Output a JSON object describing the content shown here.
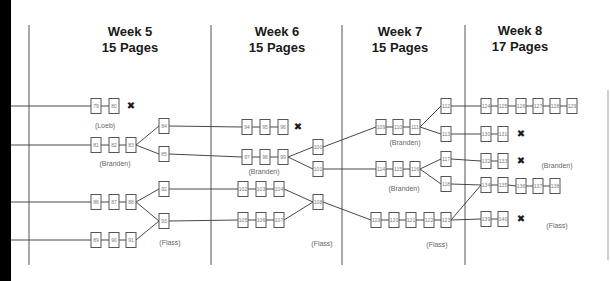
{
  "diagram": {
    "weeks": [
      {
        "title": "Week 5",
        "pages": "15 Pages",
        "x": 130
      },
      {
        "title": "Week 6",
        "pages": "15 Pages",
        "x": 277
      },
      {
        "title": "Week 7",
        "pages": "15 Pages",
        "x": 400
      },
      {
        "title": "Week 8",
        "pages": "17 Pages",
        "x": 520
      }
    ],
    "dividers": [
      29,
      211,
      342,
      465
    ],
    "nodes": [
      {
        "id": "79",
        "x": 96,
        "y": 106
      },
      {
        "id": "80",
        "x": 114,
        "y": 106
      },
      {
        "id": "81",
        "x": 96,
        "y": 145
      },
      {
        "id": "82",
        "x": 114,
        "y": 145
      },
      {
        "id": "83",
        "x": 131,
        "y": 145
      },
      {
        "id": "84",
        "x": 164,
        "y": 126
      },
      {
        "id": "85",
        "x": 164,
        "y": 154
      },
      {
        "id": "86",
        "x": 96,
        "y": 202
      },
      {
        "id": "87",
        "x": 114,
        "y": 202
      },
      {
        "id": "88",
        "x": 131,
        "y": 202
      },
      {
        "id": "89",
        "x": 96,
        "y": 240
      },
      {
        "id": "90",
        "x": 114,
        "y": 240
      },
      {
        "id": "91",
        "x": 131,
        "y": 240
      },
      {
        "id": "92",
        "x": 164,
        "y": 189
      },
      {
        "id": "93",
        "x": 164,
        "y": 221
      },
      {
        "id": "94",
        "x": 247,
        "y": 127
      },
      {
        "id": "95",
        "x": 265,
        "y": 127
      },
      {
        "id": "96",
        "x": 283,
        "y": 127
      },
      {
        "id": "97",
        "x": 247,
        "y": 157
      },
      {
        "id": "98",
        "x": 265,
        "y": 157
      },
      {
        "id": "99",
        "x": 283,
        "y": 157
      },
      {
        "id": "100",
        "x": 318,
        "y": 147
      },
      {
        "id": "101",
        "x": 318,
        "y": 169
      },
      {
        "id": "102",
        "x": 243,
        "y": 189
      },
      {
        "id": "103",
        "x": 261,
        "y": 189
      },
      {
        "id": "104",
        "x": 279,
        "y": 189
      },
      {
        "id": "105",
        "x": 243,
        "y": 220
      },
      {
        "id": "106",
        "x": 261,
        "y": 220
      },
      {
        "id": "107",
        "x": 279,
        "y": 220
      },
      {
        "id": "108",
        "x": 318,
        "y": 202
      },
      {
        "id": "109",
        "x": 381,
        "y": 127
      },
      {
        "id": "110",
        "x": 398,
        "y": 127
      },
      {
        "id": "111",
        "x": 415,
        "y": 127
      },
      {
        "id": "112",
        "x": 446,
        "y": 106
      },
      {
        "id": "113",
        "x": 446,
        "y": 134
      },
      {
        "id": "114",
        "x": 381,
        "y": 169
      },
      {
        "id": "115",
        "x": 398,
        "y": 169
      },
      {
        "id": "116",
        "x": 415,
        "y": 169
      },
      {
        "id": "117",
        "x": 446,
        "y": 159
      },
      {
        "id": "118",
        "x": 446,
        "y": 184
      },
      {
        "id": "119",
        "x": 376,
        "y": 220
      },
      {
        "id": "120",
        "x": 394,
        "y": 220
      },
      {
        "id": "121",
        "x": 411,
        "y": 220
      },
      {
        "id": "122",
        "x": 429,
        "y": 220
      },
      {
        "id": "123",
        "x": 446,
        "y": 220
      },
      {
        "id": "124",
        "x": 486,
        "y": 106
      },
      {
        "id": "125",
        "x": 503,
        "y": 106
      },
      {
        "id": "126",
        "x": 521,
        "y": 106
      },
      {
        "id": "127",
        "x": 538,
        "y": 106
      },
      {
        "id": "128",
        "x": 555,
        "y": 106
      },
      {
        "id": "129",
        "x": 572,
        "y": 106
      },
      {
        "id": "130",
        "x": 486,
        "y": 134
      },
      {
        "id": "131",
        "x": 503,
        "y": 134
      },
      {
        "id": "132",
        "x": 486,
        "y": 161
      },
      {
        "id": "133",
        "x": 503,
        "y": 161
      },
      {
        "id": "134",
        "x": 486,
        "y": 185
      },
      {
        "id": "135",
        "x": 503,
        "y": 185
      },
      {
        "id": "136",
        "x": 521,
        "y": 186
      },
      {
        "id": "137",
        "x": 538,
        "y": 186
      },
      {
        "id": "138",
        "x": 555,
        "y": 186
      },
      {
        "id": "139",
        "x": 486,
        "y": 219
      },
      {
        "id": "140",
        "x": 503,
        "y": 219
      }
    ],
    "edges": [
      [
        "79",
        "80"
      ],
      [
        "81",
        "82"
      ],
      [
        "82",
        "83"
      ],
      [
        "83",
        "84"
      ],
      [
        "83",
        "85"
      ],
      [
        "86",
        "87"
      ],
      [
        "87",
        "88"
      ],
      [
        "88",
        "92"
      ],
      [
        "88",
        "93"
      ],
      [
        "89",
        "90"
      ],
      [
        "90",
        "91"
      ],
      [
        "91",
        "93"
      ],
      [
        "84",
        "94"
      ],
      [
        "85",
        "97"
      ],
      [
        "92",
        "102"
      ],
      [
        "93",
        "105"
      ],
      [
        "94",
        "95"
      ],
      [
        "95",
        "96"
      ],
      [
        "97",
        "98"
      ],
      [
        "98",
        "99"
      ],
      [
        "99",
        "100"
      ],
      [
        "99",
        "101"
      ],
      [
        "102",
        "103"
      ],
      [
        "103",
        "104"
      ],
      [
        "104",
        "108"
      ],
      [
        "105",
        "106"
      ],
      [
        "106",
        "107"
      ],
      [
        "107",
        "108"
      ],
      [
        "100",
        "109"
      ],
      [
        "101",
        "114"
      ],
      [
        "108",
        "119"
      ],
      [
        "109",
        "110"
      ],
      [
        "110",
        "111"
      ],
      [
        "111",
        "112"
      ],
      [
        "111",
        "113"
      ],
      [
        "114",
        "115"
      ],
      [
        "115",
        "116"
      ],
      [
        "116",
        "117"
      ],
      [
        "116",
        "118"
      ],
      [
        "119",
        "120"
      ],
      [
        "120",
        "121"
      ],
      [
        "121",
        "122"
      ],
      [
        "122",
        "123"
      ],
      [
        "112",
        "124"
      ],
      [
        "113",
        "130"
      ],
      [
        "117",
        "132"
      ],
      [
        "118",
        "134"
      ],
      [
        "123",
        "134"
      ],
      [
        "123",
        "139"
      ],
      [
        "124",
        "125"
      ],
      [
        "125",
        "126"
      ],
      [
        "126",
        "127"
      ],
      [
        "127",
        "128"
      ],
      [
        "128",
        "129"
      ],
      [
        "130",
        "131"
      ],
      [
        "132",
        "133"
      ],
      [
        "134",
        "135"
      ],
      [
        "135",
        "136"
      ],
      [
        "136",
        "137"
      ],
      [
        "137",
        "138"
      ],
      [
        "139",
        "140"
      ]
    ],
    "incoming_lines_y": [
      106,
      145,
      202,
      240
    ],
    "end_marks": [
      {
        "symbol": "✖",
        "x": 131,
        "y": 106
      },
      {
        "symbol": "✖",
        "x": 298,
        "y": 127
      },
      {
        "symbol": "✖",
        "x": 521,
        "y": 134
      },
      {
        "symbol": "✖",
        "x": 521,
        "y": 161
      },
      {
        "symbol": "✖",
        "x": 521,
        "y": 219
      }
    ],
    "labels": [
      {
        "text": "(Loeb)",
        "x": 105,
        "y": 128
      },
      {
        "text": "(Branden)",
        "x": 115,
        "y": 166
      },
      {
        "text": "(Flass)",
        "x": 170,
        "y": 245
      },
      {
        "text": "(Branden)",
        "x": 264,
        "y": 174
      },
      {
        "text": "(Flass)",
        "x": 322,
        "y": 246
      },
      {
        "text": "(Branden)",
        "x": 405,
        "y": 145
      },
      {
        "text": "(Branden)",
        "x": 404,
        "y": 191
      },
      {
        "text": "(Flass)",
        "x": 437,
        "y": 247
      },
      {
        "text": "(Branden)",
        "x": 557,
        "y": 168
      },
      {
        "text": "(Flass)",
        "x": 557,
        "y": 228
      }
    ]
  }
}
